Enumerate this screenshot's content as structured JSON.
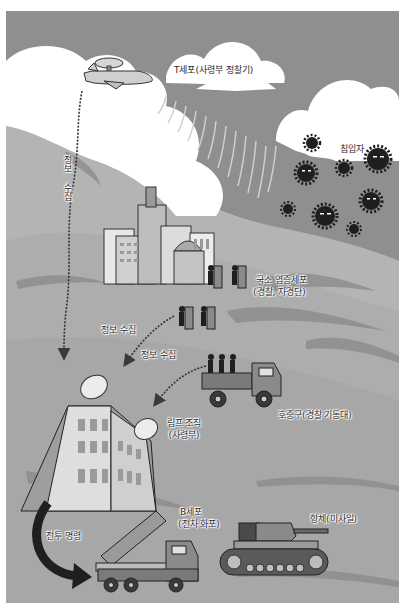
{
  "colors": {
    "sky": "#8f8f8f",
    "cloud": "#ffffff",
    "mountain": "#b4b4b4",
    "mountain_light": "#c6c6c6",
    "ground": "#a9a9a9",
    "smoke": "#7f7f7f",
    "dark": "#222222",
    "building": "#d8d8d8",
    "window": "#9a9a9a"
  },
  "labels": {
    "t_cell": "T세포(사령부 정찰기)",
    "intruder": "침입자",
    "info_vertical": "정보 수집",
    "local_immune": [
      "국소 염증세포",
      "(경찰, 자경단)"
    ],
    "info_collect_1": "정보 수집",
    "info_collect_2": "정보 수집",
    "neutrophil": "호중구(경찰 기동대)",
    "lymph": [
      "림프 조직",
      "(사령부)"
    ],
    "b_cell": [
      "B세포",
      "(전차 화포)"
    ],
    "battle_command": "전투 명령",
    "antibody": "항체(미사일)"
  },
  "icons": {
    "plane": "reconnaissance-plane-icon",
    "virus": "virus-intruder-icon",
    "city": "city-buildings-icon",
    "police": "riot-police-icon",
    "truck": "police-truck-icon",
    "hq": "headquarters-building-icon",
    "dish": "satellite-dish-icon",
    "launcher": "rocket-launcher-truck-icon",
    "tank": "tank-icon"
  }
}
